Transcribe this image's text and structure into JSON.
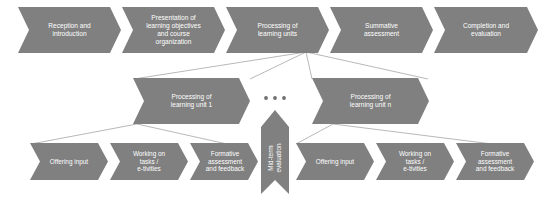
{
  "diagram": {
    "colors": {
      "chevron_fill": "#808080",
      "label_text": "#ffffff",
      "connector_line": "#9a9a9a",
      "background": "#ffffff",
      "ellipsis_dot": "#6f6f6f"
    },
    "top_row": {
      "name": "main-phase-row",
      "items": [
        {
          "id": "reception",
          "label": "Reception and\nintroduction"
        },
        {
          "id": "presentation",
          "label": "Presentation of\nlearning objectives\nand course\norganization"
        },
        {
          "id": "processing-units",
          "label": "Processing of\nlearning units"
        },
        {
          "id": "summative",
          "label": "Summative\nassessment"
        },
        {
          "id": "completion",
          "label": "Completion and\nevaluation"
        }
      ]
    },
    "middle_row": {
      "name": "learning-unit-row",
      "items": [
        {
          "id": "unit-1",
          "label": "Processing of\nlearning unit 1"
        },
        {
          "id": "unit-n",
          "label": "Processing of\nlearning unit n"
        }
      ],
      "ellipsis": "• • •"
    },
    "midterm": {
      "id": "midterm-evaluation",
      "label": "Mid-term\nevaluation",
      "orientation": "vertical-up"
    },
    "bottom_row_left": {
      "name": "unit-1-activity-row",
      "items": [
        {
          "id": "offering-input-1",
          "label": "Offering input"
        },
        {
          "id": "working-tasks-1",
          "label": "Working on\ntasks /\ne-tivities"
        },
        {
          "id": "formative-1",
          "label": "Formative\nassessment\nand feedback"
        }
      ]
    },
    "bottom_row_right": {
      "name": "unit-n-activity-row",
      "items": [
        {
          "id": "offering-input-n",
          "label": "Offering input"
        },
        {
          "id": "working-tasks-n",
          "label": "Working on\ntasks /\ne-tivities"
        },
        {
          "id": "formative-n",
          "label": "Formative\nassessment\nand feedback"
        }
      ]
    }
  }
}
